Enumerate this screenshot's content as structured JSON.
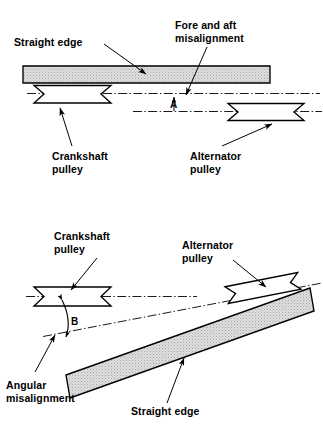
{
  "figure": {
    "background_color": "#ffffff",
    "ink_color": "#000000",
    "straight_edge_fill": "#d9d9d9"
  },
  "panels": [
    {
      "id": "top",
      "name": "fore-and-aft-misalignment-diagram",
      "labels": {
        "straight_edge": "Straight edge",
        "misalignment_line1": "Fore and aft",
        "misalignment_line2": "misalignment",
        "dimension": "A",
        "crankshaft_line1": "Crankshaft",
        "crankshaft_line2": "pulley",
        "alternator_line1": "Alternator",
        "alternator_line2": "pulley"
      }
    },
    {
      "id": "bottom",
      "name": "angular-misalignment-diagram",
      "labels": {
        "crankshaft_line1": "Crankshaft",
        "crankshaft_line2": "pulley",
        "alternator_line1": "Alternator",
        "alternator_line2": "pulley",
        "dimension": "B",
        "angular_line1": "Angular",
        "angular_line2": "misalignment",
        "straight_edge": "Straight edge"
      }
    }
  ]
}
